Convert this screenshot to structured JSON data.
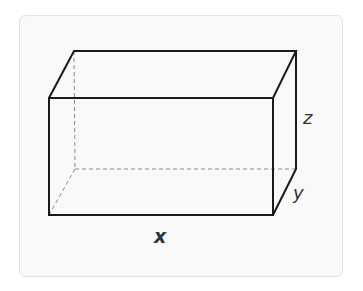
{
  "figure": {
    "type": "rectangular-prism",
    "labels": {
      "x": "x",
      "y": "y",
      "z": "z"
    },
    "colors": {
      "edge": "#1a1a1a",
      "hidden_edge": "#8a8a8a",
      "card_background": "#f9f9f9",
      "card_border": "#e4e4e4",
      "label": "#333333"
    }
  }
}
